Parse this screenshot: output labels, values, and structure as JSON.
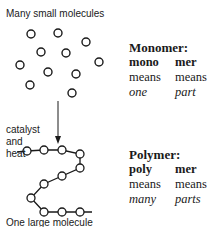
{
  "diagram": {
    "top_caption": "Many small molecules",
    "reaction_conditions": [
      "catalyst",
      "and",
      "heat"
    ],
    "bottom_caption": "One large molecule",
    "monomer_circles": [
      [
        31,
        34
      ],
      [
        58,
        33
      ],
      [
        86,
        42
      ],
      [
        41,
        52
      ],
      [
        66,
        53
      ],
      [
        99,
        62
      ],
      [
        20,
        65
      ],
      [
        48,
        72
      ],
      [
        76,
        74
      ],
      [
        30,
        85
      ],
      [
        72,
        93
      ]
    ],
    "polymer_chain": [
      [
        27,
        151
      ],
      [
        44,
        150
      ],
      [
        62,
        150
      ],
      [
        80,
        154
      ],
      [
        80,
        168
      ],
      [
        62,
        176
      ],
      [
        44,
        184
      ],
      [
        31,
        198
      ],
      [
        44,
        212
      ],
      [
        62,
        212
      ],
      [
        80,
        212
      ]
    ],
    "colors": {
      "ink": "#1a1a1a",
      "background": "#ffffff"
    }
  },
  "monomer": {
    "title": "Monomer:",
    "columns": [
      {
        "prefix": "mono",
        "means": "means",
        "meaning": "one"
      },
      {
        "prefix": "mer",
        "means": "means",
        "meaning": "part"
      }
    ]
  },
  "polymer": {
    "title": "Polymer:",
    "columns": [
      {
        "prefix": "poly",
        "means": "means",
        "meaning": "many"
      },
      {
        "prefix": "mer",
        "means": "means",
        "meaning": "parts"
      }
    ]
  }
}
